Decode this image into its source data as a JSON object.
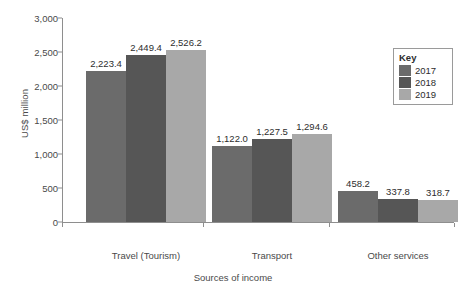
{
  "chart_data": {
    "type": "bar",
    "title": "",
    "subtitle": "",
    "xlabel": "Sources of income",
    "ylabel": "US$ million",
    "categories": [
      "Travel (Tourism)",
      "Transport",
      "Other services"
    ],
    "series": [
      {
        "name": "2017",
        "color": "#6b6b6b",
        "values": [
          2223.4,
          1122.0,
          458.2
        ],
        "labels": [
          "2223.4",
          "1122.0",
          "458.2"
        ]
      },
      {
        "name": "2018",
        "color": "#565656",
        "values": [
          2449.4,
          1227.5,
          337.8
        ],
        "labels": [
          "2449.4",
          "1227.5",
          "337.8"
        ]
      },
      {
        "name": "2019",
        "color": "#a8a8a8",
        "values": [
          2526.2,
          1294.6,
          318.7
        ],
        "labels": [
          "2526.2",
          "1294.6",
          "318.7"
        ]
      }
    ],
    "data_labels": [
      [
        "2,223.4",
        "2,449.4",
        "2,526.2"
      ],
      [
        "1,122.0",
        "1,227.5",
        "1,294.6"
      ],
      [
        "458.2",
        "337.8",
        "318.7"
      ]
    ],
    "ylim": [
      0,
      3000
    ],
    "ytick_values": [
      0,
      500,
      1000,
      1500,
      2000,
      2500,
      3000
    ],
    "ytick_labels": [
      "0",
      "500",
      "1,000",
      "1,500",
      "2,000",
      "2,500",
      "3,000"
    ],
    "grid": false,
    "legend_position": "top-right",
    "legend_title": "Key",
    "axis_color": "#8e8e8e",
    "text_color": "#4a4a4a"
  }
}
